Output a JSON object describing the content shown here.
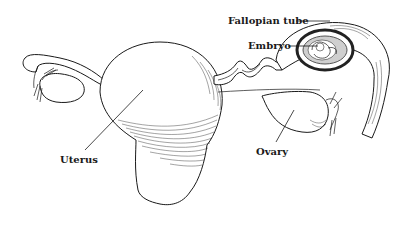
{
  "diagram": {
    "labels": {
      "fallopian_tube": "Fallopian tube",
      "embryo": "Embryo",
      "uterus": "Uterus",
      "ovary": "Ovary"
    },
    "colors": {
      "ink": "#1a1a1a",
      "background": "#ffffff",
      "sac_dark": "#222222",
      "sac_gray": "#9a9a9a"
    }
  }
}
